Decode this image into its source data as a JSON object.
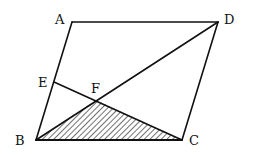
{
  "diagram": {
    "type": "parallelogram-geometry",
    "points": {
      "A": {
        "label": "A",
        "x": 72,
        "y": 22
      },
      "B": {
        "label": "B",
        "x": 36,
        "y": 140
      },
      "C": {
        "label": "C",
        "x": 182,
        "y": 140
      },
      "D": {
        "label": "D",
        "x": 218,
        "y": 22
      },
      "E": {
        "label": "E",
        "x": 54,
        "y": 82
      },
      "F": {
        "label": "F",
        "x": 96,
        "y": 100
      }
    },
    "segments": [
      "AD",
      "DC",
      "CB",
      "BA",
      "BD",
      "EC"
    ],
    "shaded_region": "triangle BFC",
    "stroke_color": "#111111"
  }
}
